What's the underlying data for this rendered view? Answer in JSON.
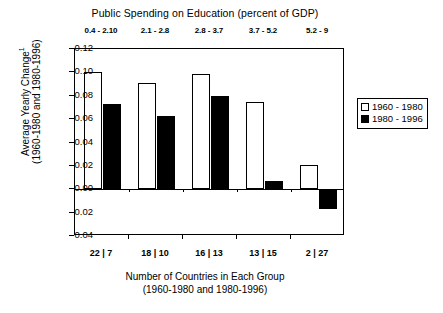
{
  "chart_data": {
    "type": "bar",
    "title": "Public Spending on Education (percent of GDP)",
    "xlabel": "Number of Countries in Each Group",
    "xlabel_sub": "(1960-1980 and 1980-1996)",
    "ylabel": "Average Yearly Change",
    "ylabel_superscript": "1",
    "ylabel_sub": "(1960-1980 and 1980-1996)",
    "categories": [
      "22 | 7",
      "18 | 10",
      "16 | 13",
      "13 | 15",
      "2 | 27"
    ],
    "top_categories": [
      "0.4 - 2.10",
      "2.1 - 2.8",
      "2.8 - 3.7",
      "3.7 - 5.2",
      "5.2 - 9"
    ],
    "series": [
      {
        "name": "1960 - 1980",
        "color": "#ffffff",
        "values": [
          0.1,
          0.091,
          0.099,
          0.075,
          0.021
        ]
      },
      {
        "name": "1980 - 1996",
        "color": "#000000",
        "values": [
          0.073,
          0.063,
          0.08,
          0.007,
          -0.017
        ]
      }
    ],
    "ylim": [
      -0.04,
      0.12
    ],
    "yticks": [
      "0.12",
      "0.10",
      "0.08",
      "0.06",
      "0.04",
      "0.02",
      "0.00",
      "-0.02",
      "-0.04"
    ],
    "ytick_values": [
      0.12,
      0.1,
      0.08,
      0.06,
      0.04,
      0.02,
      0.0,
      -0.02,
      -0.04
    ],
    "grid": false,
    "legend_position": "right"
  },
  "legend": {
    "items": [
      {
        "label": "1960 - 1980"
      },
      {
        "label": "1980 - 1996"
      }
    ]
  }
}
